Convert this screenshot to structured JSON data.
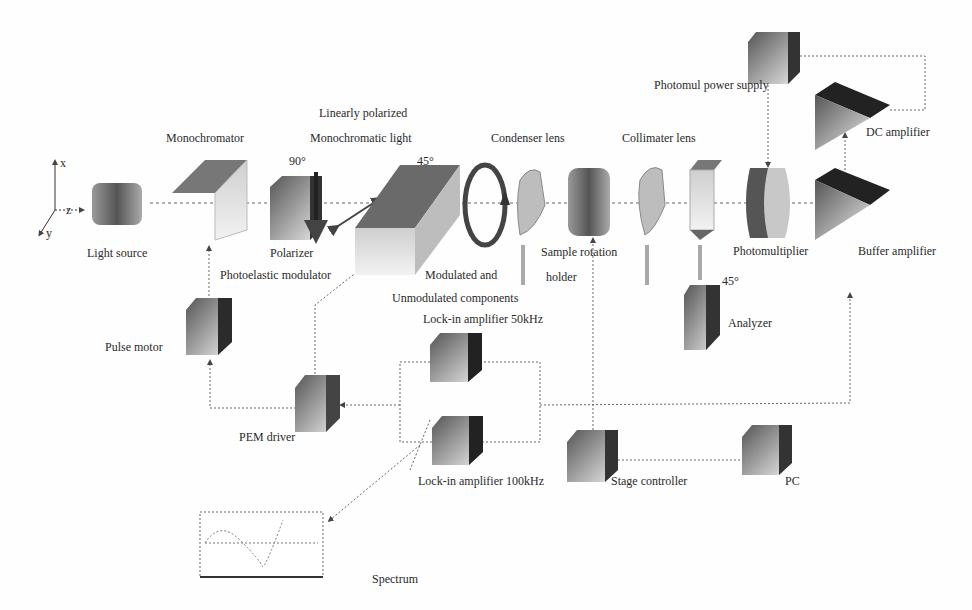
{
  "axes": {
    "x": "x",
    "y": "y",
    "z": "z"
  },
  "labels": {
    "light_source": "Light source",
    "monochromator": "Monochromator",
    "linearly_polarized": "Linearly polarized",
    "monochromatic_light": "Monochromatic light",
    "polarizer": "Polarizer",
    "polarizer_angle": "90°",
    "pem_angle": "45°",
    "photoelastic_modulator": "Photoelastic modulator",
    "condenser_lens": "Condenser lens",
    "modulated_and": "Modulated and",
    "unmodulated_components": "Unmodulated components",
    "sample_rotation": "Sample rotation",
    "holder": "holder",
    "collimater_lens": "Collimater lens",
    "analyzer": "Analyzer",
    "analyzer_angle": "45°",
    "photomul_power_supply": "Photomul power supply",
    "photomultiplier": "Photomultiplier",
    "dc_amplifier": "DC amplifier",
    "buffer_amplifier": "Buffer amplifier",
    "pulse_motor": "Pulse motor",
    "pem_driver": "PEM driver",
    "lockin_50": "Lock-in amplifier 50kHz",
    "lockin_100": "Lock-in amplifier 100kHz",
    "stage_controller": "Stage controller",
    "pc": "PC",
    "spectrum": "Spectrum"
  },
  "colors": {
    "dark": "#2b2b2b",
    "mid": "#7a7a7a",
    "light": "#d0d0d0",
    "line": "#555555"
  }
}
